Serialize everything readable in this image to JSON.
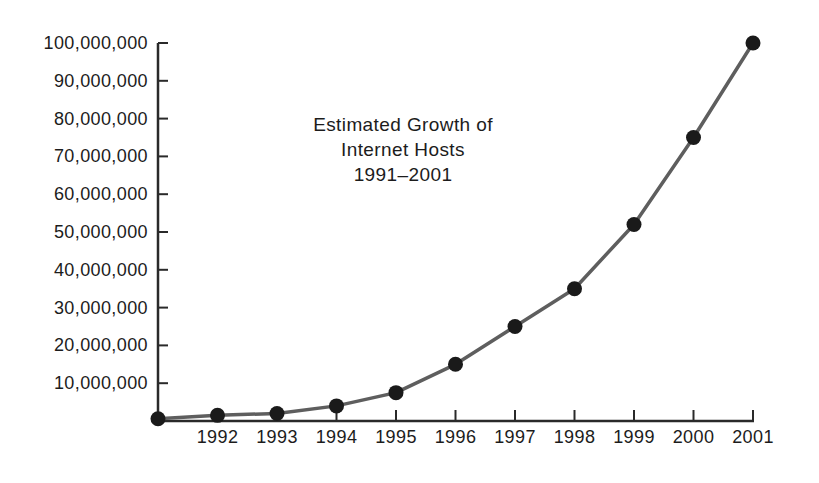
{
  "figure": {
    "title_lines": [
      "Estimated Growth of",
      "Internet Hosts",
      "1991–2001"
    ]
  },
  "chart_data": {
    "type": "line",
    "title": "Estimated Growth of Internet Hosts 1991–2001",
    "xlabel": "",
    "ylabel": "",
    "grid": false,
    "legend": null,
    "x": [
      1991,
      1992,
      1993,
      1994,
      1995,
      1996,
      1997,
      1998,
      1999,
      2000,
      2001
    ],
    "values": [
      600000,
      1500000,
      2000000,
      4000000,
      7500000,
      15000000,
      25000000,
      35000000,
      52000000,
      75000000,
      100000000
    ],
    "x_ticks": [
      1992,
      1993,
      1994,
      1995,
      1996,
      1997,
      1998,
      1999,
      2000,
      2001
    ],
    "x_tick_labels": [
      "1992",
      "1993",
      "1994",
      "1995",
      "1996",
      "1997",
      "1998",
      "1999",
      "2000",
      "2001"
    ],
    "y_ticks": [
      10000000,
      20000000,
      30000000,
      40000000,
      50000000,
      60000000,
      70000000,
      80000000,
      90000000,
      100000000
    ],
    "y_tick_labels": [
      "10,000,000",
      "20,000,000",
      "30,000,000",
      "40,000,000",
      "50,000,000",
      "60,000,000",
      "70,000,000",
      "80,000,000",
      "90,000,000",
      "100,000,000"
    ],
    "xlim": [
      1991,
      2001
    ],
    "ylim": [
      0,
      100000000
    ],
    "line_color": "#5e5e5e",
    "marker_color": "#1a1a1a",
    "axis_color": "#2a2a2a",
    "text_color": "#1c1c1c"
  }
}
